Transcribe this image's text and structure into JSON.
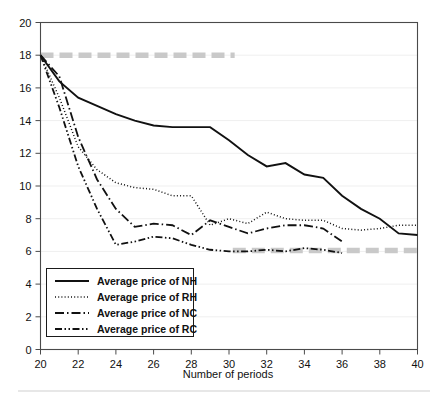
{
  "chart_data": {
    "type": "line",
    "title": "",
    "xlabel": "Number of periods",
    "ylabel": "",
    "xlim": [
      20,
      40
    ],
    "ylim": [
      0,
      20
    ],
    "xticks": [
      20,
      22,
      24,
      26,
      28,
      30,
      32,
      34,
      36,
      38,
      40
    ],
    "yticks": [
      0,
      2,
      4,
      6,
      8,
      10,
      12,
      14,
      16,
      18,
      20
    ],
    "grid": true,
    "legend_position": "lower-left-inside",
    "x": [
      20,
      21,
      22,
      23,
      24,
      25,
      26,
      27,
      28,
      29,
      30,
      31,
      32,
      33,
      34,
      35,
      36,
      37,
      38,
      39,
      40
    ],
    "series": [
      {
        "name": "Average price of NH",
        "key": "NH",
        "dash": "none",
        "color": "#111111",
        "width": 1.9,
        "values": [
          18.0,
          16.4,
          15.4,
          14.9,
          14.4,
          14.0,
          13.7,
          13.6,
          13.6,
          13.6,
          12.8,
          11.9,
          11.2,
          11.4,
          10.7,
          10.5,
          9.4,
          8.6,
          8.0,
          7.1,
          7.0
        ]
      },
      {
        "name": "Average price of RH",
        "key": "RH",
        "dash": "1,2.2",
        "color": "#111111",
        "width": 1.5,
        "values": [
          18.0,
          15.4,
          12.4,
          11.0,
          10.2,
          9.9,
          9.8,
          9.4,
          9.4,
          7.6,
          8.0,
          7.7,
          8.4,
          8.0,
          7.9,
          7.9,
          7.4,
          7.3,
          7.4,
          7.6,
          7.6
        ]
      },
      {
        "name": "Average price of NC",
        "key": "NC",
        "dash": "9,3,1.5,3",
        "color": "#111111",
        "width": 1.8,
        "values": [
          18.0,
          16.7,
          13.0,
          10.4,
          8.6,
          7.5,
          7.7,
          7.6,
          7.0,
          7.9,
          7.5,
          7.1,
          7.4,
          7.6,
          7.6,
          7.4,
          6.6,
          null,
          null,
          null,
          null
        ]
      },
      {
        "name": "Average price of RC",
        "key": "RC",
        "dash": "7,2.5,1.5,2.5,1.5,2.5",
        "color": "#111111",
        "width": 1.8,
        "values": [
          18.0,
          14.8,
          11.2,
          8.6,
          6.4,
          6.6,
          6.9,
          6.8,
          6.4,
          6.1,
          6.0,
          6.0,
          6.1,
          6.0,
          6.2,
          6.1,
          5.9,
          null,
          null,
          null,
          null
        ]
      }
    ],
    "reference_lines": [
      {
        "name": "upper-gray-dashed",
        "y": 18.0,
        "x_start": 20,
        "x_end": 30.3,
        "color": "#c9c9c9",
        "width": 5.5,
        "dash": "13,6"
      },
      {
        "name": "lower-gray-dashed",
        "y": 6.05,
        "x_start": 30.2,
        "x_end": 40,
        "color": "#c9c9c9",
        "width": 5.5,
        "dash": "13,6"
      }
    ]
  },
  "legend": {
    "items": [
      {
        "label": "Average price of NH",
        "sample": "solid"
      },
      {
        "label": "Average price of RH",
        "sample": "dotted"
      },
      {
        "label": "Average price of NC",
        "sample": "dash-dot"
      },
      {
        "label": "Average price of RC",
        "sample": "dash-dot-dot"
      }
    ]
  },
  "axes": {
    "x_title": "Number of periods"
  }
}
